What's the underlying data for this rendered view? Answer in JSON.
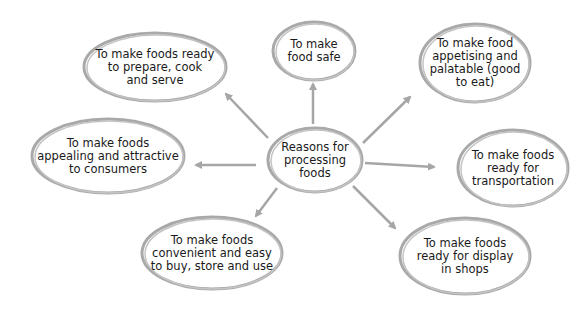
{
  "diagram": {
    "type": "mind-map",
    "center": {
      "id": "center",
      "label": "Reasons for\nprocessing\nfoods"
    },
    "nodes": [
      {
        "id": "ready-prepare",
        "label": "To make foods ready\nto prepare, cook\nand serve"
      },
      {
        "id": "food-safe",
        "label": "To make\nfood safe"
      },
      {
        "id": "appetising",
        "label": "To make food\nappetising and\npalatable (good\nto eat)"
      },
      {
        "id": "appealing",
        "label": "To make foods\nappealing and attractive\nto consumers"
      },
      {
        "id": "transportation",
        "label": "To make foods\nready for\ntransportation"
      },
      {
        "id": "convenient",
        "label": "To make foods\nconvenient and easy\nto buy, store and use"
      },
      {
        "id": "display",
        "label": "To make foods\nready for display\nin shops"
      }
    ],
    "edges": [
      {
        "from": "center",
        "to": "ready-prepare"
      },
      {
        "from": "center",
        "to": "food-safe"
      },
      {
        "from": "center",
        "to": "appetising"
      },
      {
        "from": "center",
        "to": "appealing"
      },
      {
        "from": "center",
        "to": "transportation"
      },
      {
        "from": "center",
        "to": "convenient"
      },
      {
        "from": "center",
        "to": "display"
      }
    ],
    "colors": {
      "stroke": "#a9a9a9",
      "arrow": "#a6a6a6",
      "text": "#1a1a1a"
    }
  }
}
